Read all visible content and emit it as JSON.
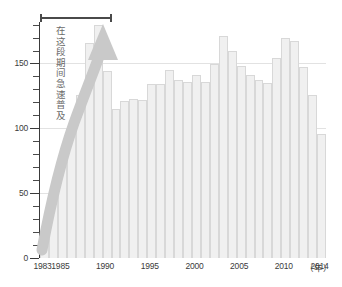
{
  "chart_data": {
    "type": "bar",
    "title": "",
    "subtitle": "",
    "xlabel": "年",
    "ylabel": "",
    "xlim": [
      1983,
      2014
    ],
    "ylim": [
      0,
      182
    ],
    "grid": true,
    "legend": null,
    "y_ticks_major": [
      0,
      50,
      100,
      150
    ],
    "y_tick_interval_minor": 10,
    "x_tick_labels": [
      "1983",
      "1985",
      "1990",
      "1995",
      "2000",
      "2005",
      "2010",
      "2014"
    ],
    "x_unit_label": "（年）",
    "categories": [
      "1983",
      "1984",
      "1985",
      "1986",
      "1987",
      "1988",
      "1989",
      "1990",
      "1991",
      "1992",
      "1993",
      "1994",
      "1995",
      "1996",
      "1997",
      "1998",
      "1999",
      "2000",
      "2001",
      "2002",
      "2003",
      "2004",
      "2005",
      "2006",
      "2007",
      "2008",
      "2009",
      "2010",
      "2011",
      "2012",
      "2013",
      "2014"
    ],
    "values": [
      14,
      45,
      73,
      101,
      126,
      166,
      180,
      144,
      115,
      121,
      123,
      122,
      134,
      134,
      145,
      137,
      136,
      141,
      136,
      150,
      171,
      160,
      148,
      141,
      137,
      135,
      154,
      170,
      167,
      147,
      126,
      96
    ],
    "annotations": [
      {
        "type": "bracket",
        "name": "period-bracket",
        "from": "1983",
        "to": "1990",
        "label": ""
      },
      {
        "type": "arrow",
        "name": "growth-arrow",
        "direction": "up",
        "label": "在这段期间急速普及"
      }
    ],
    "note_text": "在这段期间急速普及"
  },
  "colors": {
    "bar_fill": "#f0f0f0",
    "bar_stroke": "#d8d8d8",
    "arrow": "#c9c9c9",
    "axis": "#3a3a3a",
    "grid": "#e2e2e2",
    "text": "#3b3b3b",
    "note_text": "#6a6a6a",
    "background": "#ffffff"
  },
  "axis": {
    "y_label_0": "0",
    "y_label_50": "50",
    "y_label_100": "100",
    "y_label_150": "150",
    "x_label_1983": "1983",
    "x_label_1985": "1985",
    "x_label_1990": "1990",
    "x_label_1995": "1995",
    "x_label_2000": "2000",
    "x_label_2005": "2005",
    "x_label_2010": "2010",
    "x_label_2014": "2014",
    "x_unit": "（年）"
  }
}
